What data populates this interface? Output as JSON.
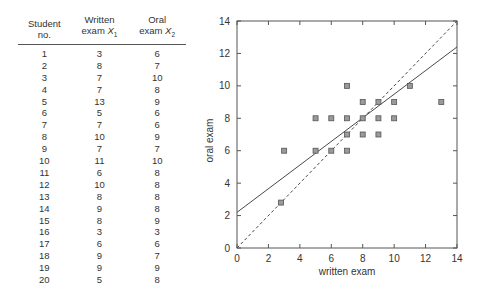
{
  "table": {
    "headers": [
      {
        "line1": "Student",
        "line2": "no.",
        "sub": ""
      },
      {
        "line1": "Written",
        "line2": "exam X",
        "sub": "1"
      },
      {
        "line1": "Oral",
        "line2": "exam X",
        "sub": "2"
      }
    ],
    "rows": [
      [
        "1",
        "3",
        "6"
      ],
      [
        "2",
        "8",
        "7"
      ],
      [
        "3",
        "7",
        "10"
      ],
      [
        "4",
        "7",
        "8"
      ],
      [
        "5",
        "13",
        "9"
      ],
      [
        "6",
        "5",
        "6"
      ],
      [
        "7",
        "7",
        "6"
      ],
      [
        "8",
        "10",
        "9"
      ],
      [
        "9",
        "7",
        "7"
      ],
      [
        "10",
        "11",
        "10"
      ],
      [
        "11",
        "6",
        "8"
      ],
      [
        "12",
        "10",
        "8"
      ],
      [
        "13",
        "8",
        "8"
      ],
      [
        "14",
        "9",
        "8"
      ],
      [
        "15",
        "8",
        "9"
      ],
      [
        "16",
        "3",
        "3"
      ],
      [
        "17",
        "6",
        "6"
      ],
      [
        "18",
        "9",
        "7"
      ],
      [
        "19",
        "9",
        "9"
      ],
      [
        "20",
        "5",
        "8"
      ]
    ]
  },
  "chart_data": {
    "type": "scatter",
    "title": "",
    "xlabel": "written exam",
    "ylabel": "oral exam",
    "xlim": [
      0,
      14
    ],
    "ylim": [
      0,
      14
    ],
    "xticks": [
      0,
      2,
      4,
      6,
      8,
      10,
      12,
      14
    ],
    "yticks": [
      0,
      2,
      4,
      6,
      8,
      10,
      12,
      14
    ],
    "grid": false,
    "legend": null,
    "series": [
      {
        "name": "students",
        "marker": "square",
        "points": [
          [
            3,
            6
          ],
          [
            8,
            7
          ],
          [
            7,
            10
          ],
          [
            7,
            8
          ],
          [
            13,
            9
          ],
          [
            5,
            6
          ],
          [
            7,
            6
          ],
          [
            10,
            9
          ],
          [
            7,
            7
          ],
          [
            11,
            10
          ],
          [
            6,
            8
          ],
          [
            10,
            8
          ],
          [
            8,
            8
          ],
          [
            9,
            8
          ],
          [
            8,
            9
          ],
          [
            2.8,
            2.8
          ],
          [
            6,
            6
          ],
          [
            9,
            7
          ],
          [
            9,
            9
          ],
          [
            5,
            8
          ]
        ]
      }
    ],
    "lines": [
      {
        "name": "regression line",
        "style": "solid",
        "from": [
          0,
          2.2
        ],
        "to": [
          14,
          12.4
        ]
      },
      {
        "name": "identity line y=x",
        "style": "dashed",
        "from": [
          0,
          0
        ],
        "to": [
          14,
          14
        ]
      }
    ]
  },
  "colors": {
    "marker_fill": "#9a9a9a",
    "marker_stroke": "#555555",
    "axis": "#555555",
    "line": "#333333"
  }
}
